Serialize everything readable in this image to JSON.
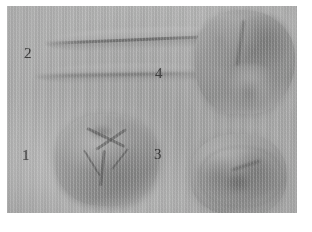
{
  "plate": {
    "medium": "grayscale photographic plate",
    "background_color": "#b4b6b4",
    "margin_color": "#ffffff",
    "specimen_count": 4
  },
  "labels": [
    {
      "id": "1",
      "text": "1",
      "specimen": "molar-crown-lower-left"
    },
    {
      "id": "2",
      "text": "2",
      "specimen": "flat-blade-ridges-upper-left"
    },
    {
      "id": "3",
      "text": "3",
      "specimen": "specimen-bottom-right"
    },
    {
      "id": "4",
      "text": "4",
      "specimen": "specimen-top-right"
    }
  ]
}
